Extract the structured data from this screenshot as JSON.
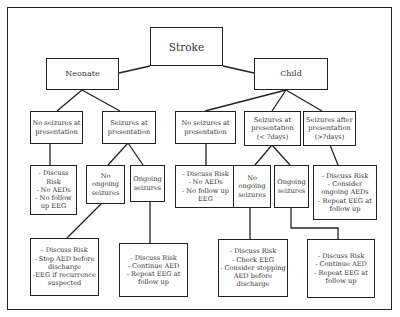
{
  "diagram": {
    "root": {
      "label": "Stroke"
    },
    "branches": {
      "neonate": {
        "label": "Neonate",
        "no_seizures": {
          "label": "No seizures at\npresentation",
          "outcome": "- Discuss\nRisk\n- No AEDs\n- No follow\nup EEG"
        },
        "seizures": {
          "label": "Seizures at\npresentation",
          "no_ongoing": {
            "label": "No\nongoing\nseizures",
            "outcome": "- Discuss Risk\n- Stop AED before\ndischarge\n-EEG if recurrence\nsuspected"
          },
          "ongoing": {
            "label": "Ongoing\nseizures",
            "outcome": "- Discuss Risk\n- Continue AED\n- Repeat EEG at\nfollow up"
          }
        }
      },
      "child": {
        "label": "Child",
        "no_seizures": {
          "label": "No seizures at\npresentation",
          "outcome": "- Discuss Risk\n- No AEDs\n- No follow up\nEEG"
        },
        "seizures_early": {
          "label": "Seizures at\npresentation\n(< ?days)",
          "no_ongoing": {
            "label": "No\nongoing\nseizures",
            "outcome": "- Discuss Risk\n- Check EEG\n- Consider stopping\nAED before\ndischarge"
          },
          "ongoing": {
            "label": "Ongoing\nseizures",
            "outcome": "- Discuss Risk\n- Continue AED\n- Repeat EEG at\nfollow up"
          }
        },
        "seizures_late": {
          "label": "Seizures after\npresentation\n(>?days)",
          "outcome": "- Discuss Risk\n- Consider\nongoing AEDs\n- Repeat EEG at\nfollow up"
        }
      }
    }
  }
}
